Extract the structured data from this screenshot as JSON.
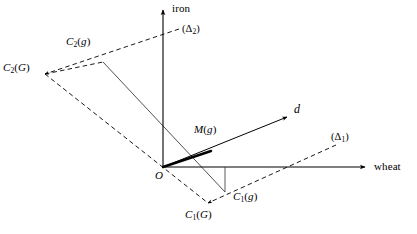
{
  "figure": {
    "type": "geometric-diagram",
    "background_color": "#ffffff",
    "stroke_color": "#000000"
  },
  "axes": {
    "vertical": {
      "name": "iron",
      "label": "iron",
      "origin": [
        163,
        167
      ],
      "tip": [
        163,
        7
      ],
      "arrow": true
    },
    "horizontal": {
      "name": "wheat",
      "label": "wheat",
      "origin": [
        163,
        167
      ],
      "tip": [
        369,
        167
      ],
      "arrow": true
    }
  },
  "origin": {
    "label": "O",
    "x": 163,
    "y": 167
  },
  "points": [
    {
      "id": "C2g",
      "label_main": "C",
      "label_sub": "2",
      "label_tail": "(g)",
      "x": 103,
      "y": 62,
      "label_x": 66,
      "label_y": 36
    },
    {
      "id": "C2G",
      "label_main": "C",
      "label_sub": "2",
      "label_tail": "(G)",
      "x": 45,
      "y": 74,
      "label_x": 3,
      "label_y": 62
    },
    {
      "id": "C1g",
      "label_main": "C",
      "label_sub": "1",
      "label_tail": "(g)",
      "x": 225,
      "y": 192,
      "label_x": 232,
      "label_y": 194
    },
    {
      "id": "C1G",
      "label_main": "C",
      "label_sub": "1",
      "label_tail": "(G)",
      "x": 208,
      "y": 203,
      "label_x": 185,
      "label_y": 208
    },
    {
      "id": "Mg",
      "label_main": "M",
      "label_sub": "",
      "label_tail": "(g)",
      "x": 210,
      "y": 151,
      "label_x": 195,
      "label_y": 126
    }
  ],
  "lines": {
    "delta1": {
      "label": "(Δ1)",
      "label_main": "(Δ",
      "label_sub": "1",
      "label_tail": ")",
      "style": "dashed",
      "from": [
        208,
        203
      ],
      "to": [
        336,
        145
      ],
      "arrow_at_start": true,
      "label_x": 332,
      "label_y": 135
    },
    "delta2": {
      "label": "(Δ2)",
      "label_main": "(Δ",
      "label_sub": "2",
      "label_tail": ")",
      "style": "dashed",
      "from": [
        45,
        74
      ],
      "to": [
        179,
        29
      ],
      "arrow_at_start": true,
      "label_x": 182,
      "label_y": 26
    },
    "direction_d": {
      "label": "d",
      "style": "solid",
      "from": [
        163,
        167
      ],
      "to": [
        290,
        116
      ],
      "arrow": true,
      "label_x": 294,
      "label_y": 108
    },
    "budget_line": {
      "style": "solid",
      "from": [
        103,
        62
      ],
      "to": [
        225,
        192
      ]
    },
    "frontier_line": {
      "style": "dashed",
      "from": [
        45,
        74
      ],
      "to": [
        208,
        203
      ]
    },
    "bold_segment": {
      "style": "solid-bold",
      "from": [
        163,
        167
      ],
      "to": [
        210,
        151
      ]
    },
    "vertical_drop": {
      "style": "solid",
      "from": [
        225,
        192
      ],
      "to": [
        225,
        167
      ]
    }
  },
  "labels": {
    "iron_axis": "iron",
    "wheat_axis": "wheat",
    "origin": "O",
    "direction": "d"
  }
}
